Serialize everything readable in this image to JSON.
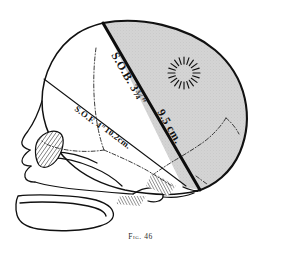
{
  "figure": {
    "caption": "Fig. 46",
    "background_color": "#ffffff",
    "ink_color": "#111111",
    "shaded_region_color": "#d2d2d2",
    "shaded_region_name": "posterior-cranial-segment"
  },
  "measurements": [
    {
      "id": "sob",
      "abbreviation": "S.O.B.",
      "inches": "3¾″",
      "centimetres": "9.5 cm.",
      "label_primary": "S.O.B. 3¾″",
      "label_secondary": "9.5 cm.",
      "line_style": "thick-solid"
    },
    {
      "id": "sof",
      "abbreviation": "S.O.F.",
      "inches": "4″",
      "centimetres": "10.2cm.",
      "label_primary": "S.O.F. 4″",
      "label_secondary": "10.2cm.",
      "line_style": "thin-solid"
    }
  ],
  "anatomy": [
    {
      "id": "fontanelle",
      "name": "anterior-fontanelle-sunburst",
      "render": "radial-dashes",
      "dash_count": 20
    },
    {
      "id": "orbit",
      "name": "orbital-cavity",
      "render": "cross-hatched"
    },
    {
      "id": "coronal-suture",
      "name": "coronal-suture",
      "render": "dash-dot"
    },
    {
      "id": "lambdoid-suture",
      "name": "lambdoid-suture",
      "render": "dash-dot"
    },
    {
      "id": "mandible",
      "name": "mandible",
      "render": "outline"
    },
    {
      "id": "maxilla",
      "name": "maxilla",
      "render": "outline"
    },
    {
      "id": "petrous-hatching",
      "name": "petrous-temporal-hatching",
      "render": "parallel-hatch"
    }
  ]
}
